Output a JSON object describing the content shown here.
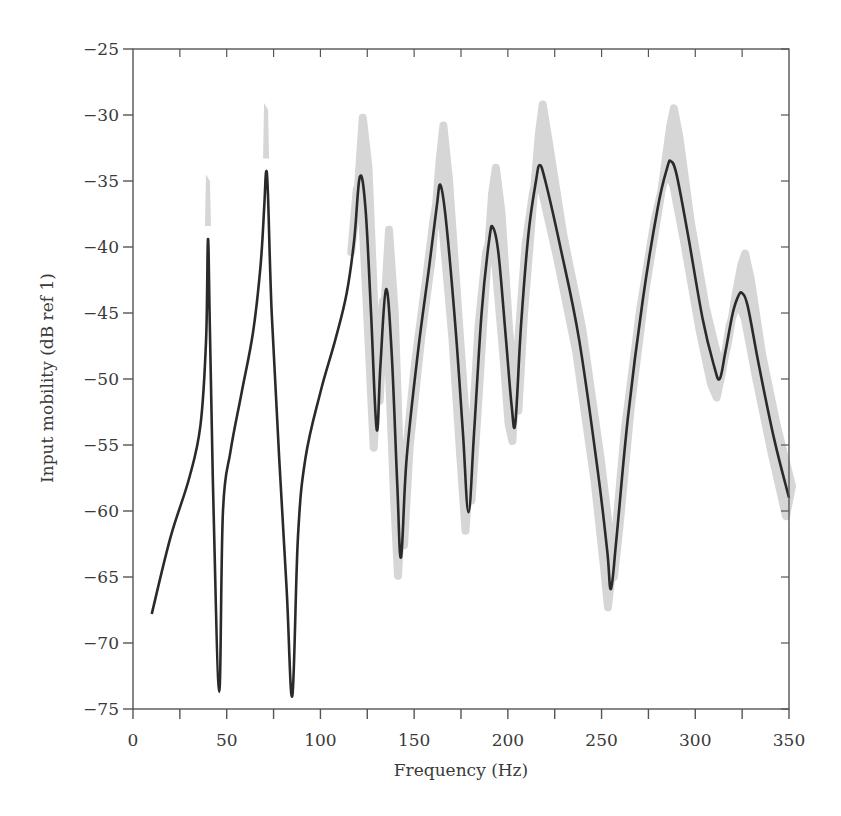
{
  "chart_data": {
    "type": "line",
    "title": "",
    "xlabel": "Frequency (Hz)",
    "ylabel": "Input mobility (dB ref 1)",
    "xlim": [
      0,
      350
    ],
    "ylim": [
      -75,
      -25
    ],
    "xticks": [
      0,
      50,
      100,
      150,
      200,
      250,
      300,
      350
    ],
    "xminor_ticks": [
      25,
      75,
      125,
      175,
      225,
      275,
      325
    ],
    "yticks": [
      -25,
      -30,
      -35,
      -40,
      -45,
      -50,
      -55,
      -60,
      -65,
      -70,
      -75
    ],
    "grid": false,
    "legend": null,
    "colors": {
      "line": "#2a2a2a",
      "band": "#d6d6d6",
      "axis": "#555555"
    },
    "series": [
      {
        "name": "Mean input mobility",
        "style": "line",
        "x": [
          10,
          20,
          30,
          36,
          39,
          40,
          41,
          43,
          46,
          48,
          52,
          58,
          64,
          68,
          70,
          71,
          72,
          74,
          78,
          82,
          85,
          88,
          92,
          100,
          108,
          114,
          118,
          121,
          124,
          127,
          130,
          132,
          135,
          138,
          141,
          143,
          146,
          152,
          158,
          162,
          164,
          167,
          172,
          176,
          179,
          182,
          186,
          190,
          192,
          195,
          199,
          202,
          204,
          207,
          211,
          215,
          217,
          220,
          228,
          238,
          248,
          253,
          255,
          258,
          264,
          272,
          280,
          285,
          287,
          290,
          296,
          304,
          310,
          313,
          316,
          320,
          323,
          325,
          328,
          334,
          342,
          350
        ],
        "y": [
          -67.8,
          -62,
          -57.5,
          -53.5,
          -47,
          -39.4,
          -46,
          -60,
          -73.7,
          -60,
          -55.5,
          -51,
          -46.5,
          -41.5,
          -37,
          -34.3,
          -36,
          -45,
          -56,
          -66,
          -74,
          -62,
          -56,
          -51,
          -47,
          -43.5,
          -39.5,
          -34.7,
          -37,
          -45,
          -53.8,
          -49,
          -43.2,
          -48,
          -58,
          -63.5,
          -56,
          -48,
          -41.5,
          -37,
          -35.3,
          -38,
          -46,
          -54,
          -60.1,
          -54,
          -45,
          -39.5,
          -38.5,
          -40.5,
          -47,
          -52,
          -53.3,
          -46,
          -39,
          -35,
          -33.8,
          -35,
          -40,
          -47,
          -57,
          -63,
          -65.9,
          -62,
          -53,
          -44,
          -37,
          -34,
          -33.5,
          -34.5,
          -39,
          -45.5,
          -49,
          -50,
          -48,
          -45,
          -43.7,
          -43.5,
          -44.5,
          -49,
          -54.5,
          -59
        ]
      },
      {
        "name": "Variability band",
        "style": "area",
        "description": "Shaded grey envelope around the mean curve (uncertainty), widest above resonance peaks",
        "peaks_upper": [
          {
            "x": 40,
            "y": -35
          },
          {
            "x": 71,
            "y": -29.6
          },
          {
            "x": 121,
            "y": -30.2
          },
          {
            "x": 135,
            "y": -38.7
          },
          {
            "x": 164,
            "y": -30.8
          },
          {
            "x": 192,
            "y": -34
          },
          {
            "x": 217,
            "y": -29.2
          },
          {
            "x": 287,
            "y": -29.5
          },
          {
            "x": 325,
            "y": -40.5
          }
        ],
        "troughs_lower": [
          {
            "x": 130,
            "y": -55
          },
          {
            "x": 143,
            "y": -64
          },
          {
            "x": 179,
            "y": -60.5
          },
          {
            "x": 204,
            "y": -54.3
          },
          {
            "x": 255,
            "y": -66.2
          },
          {
            "x": 313,
            "y": -51.6
          },
          {
            "x": 350,
            "y": -61.2
          }
        ]
      }
    ],
    "annotations": []
  }
}
